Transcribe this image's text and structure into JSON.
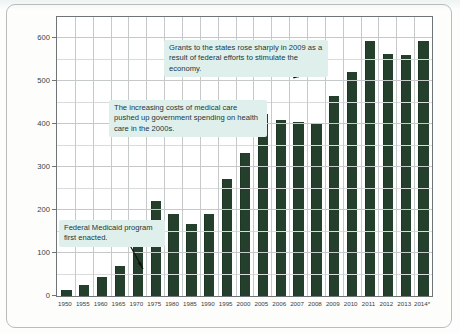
{
  "chart_data": {
    "type": "bar",
    "title": "",
    "xlabel": "",
    "ylabel": "BILLIONS OF CONSTANT (FY 2005) DOLLARS",
    "ylim": [
      0,
      650
    ],
    "yticks": [
      0,
      100,
      200,
      300,
      400,
      500,
      600
    ],
    "grid": true,
    "legend": "none",
    "bar_color": "#24402c",
    "categories": [
      "1950",
      "1955",
      "1960",
      "1965",
      "1970",
      "1975",
      "1980",
      "1985",
      "1990",
      "1995",
      "2000",
      "2005",
      "2006",
      "2007",
      "2008",
      "2009",
      "2010",
      "2011",
      "2012",
      "2013",
      "2014*"
    ],
    "values": [
      15,
      25,
      45,
      70,
      130,
      222,
      190,
      168,
      192,
      272,
      333,
      423,
      411,
      406,
      403,
      465,
      521,
      595,
      564,
      562,
      594
    ],
    "annotations": [
      {
        "id": "grants-2009",
        "text": "Grants to the states rose sharply in 2009 as a result of federal efforts to stimulate the economy.",
        "points_to": "2009"
      },
      {
        "id": "medical-costs-2000s",
        "text": "The increasing costs of medical care pushed up government spending on health care in the 2000s.",
        "points_to": "2005"
      },
      {
        "id": "medicaid-enacted",
        "text": "Federal Medicaid program first enacted.",
        "points_to": "1965"
      }
    ]
  },
  "axis": {
    "ytick_labels": [
      "600",
      "500",
      "400",
      "300",
      "200",
      "100",
      "0"
    ],
    "xtick_labels": [
      "1950",
      "1955",
      "1960",
      "1965",
      "1970",
      "1975",
      "1980",
      "1985",
      "1990",
      "1995",
      "2000",
      "2005",
      "2006",
      "2007",
      "2008",
      "2009",
      "2010",
      "2011",
      "2012",
      "2013",
      "2014*"
    ]
  },
  "colors": {
    "bar": "#24402c",
    "note_background": "#dff0ec",
    "grid": "#c6c9ca",
    "axis": "#6f7577"
  }
}
